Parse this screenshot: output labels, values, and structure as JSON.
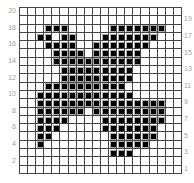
{
  "chart_data": {
    "type": "heatmap",
    "title": "",
    "rows": 20,
    "cols": 20,
    "row_labels_left": [
      "20",
      "18",
      "16",
      "14",
      "12",
      "10",
      "8",
      "6",
      "4",
      "2"
    ],
    "row_labels_right": [
      "19",
      "17",
      "15",
      "13",
      "11",
      "9",
      "7",
      "5",
      "3",
      "1"
    ],
    "filled": {
      "20": [],
      "19": [],
      "18": [
        4,
        5,
        6,
        12,
        13,
        14,
        15,
        16,
        17,
        18
      ],
      "17": [
        3,
        4,
        6,
        7,
        11,
        12,
        13,
        14,
        15,
        16,
        17
      ],
      "16": [
        4,
        5,
        6,
        7,
        10,
        11,
        12,
        13,
        14,
        15,
        16
      ],
      "15": [
        5,
        6,
        7,
        8,
        10,
        11,
        12,
        13,
        14,
        15
      ],
      "14": [
        5,
        6,
        7,
        8,
        9,
        10,
        11,
        12,
        13,
        14,
        15
      ],
      "13": [
        6,
        7,
        8,
        9,
        10,
        11,
        12,
        13,
        14
      ],
      "12": [
        6,
        7,
        8,
        9,
        10,
        11,
        12,
        13,
        14
      ],
      "11": [
        4,
        5,
        6,
        7,
        8,
        9,
        10,
        11,
        12,
        13
      ],
      "10": [
        3,
        4,
        5,
        6,
        7,
        8,
        9,
        10,
        11,
        12,
        13,
        14
      ],
      "9": [
        3,
        4,
        5,
        6,
        7,
        8,
        9,
        10,
        11,
        12,
        13,
        14,
        15,
        16,
        17,
        18
      ],
      "8": [
        3,
        4,
        5,
        6,
        7,
        8,
        10,
        11,
        12,
        13,
        14,
        15,
        16,
        17,
        18
      ],
      "7": [
        3,
        4,
        5,
        6,
        11,
        12,
        13,
        14,
        15,
        16,
        17,
        18
      ],
      "6": [
        3,
        4,
        5,
        11,
        12,
        13,
        14,
        15,
        16,
        17
      ],
      "5": [
        3,
        4,
        12,
        13,
        14,
        15,
        16,
        17
      ],
      "4": [
        3,
        12,
        13,
        14,
        15,
        16
      ],
      "3": [
        12,
        13,
        14
      ],
      "2": [],
      "1": []
    },
    "colors": {
      "filled": "#000000",
      "empty": "#ffffff",
      "grid": "#444444",
      "label": "#a0a0a0"
    }
  }
}
